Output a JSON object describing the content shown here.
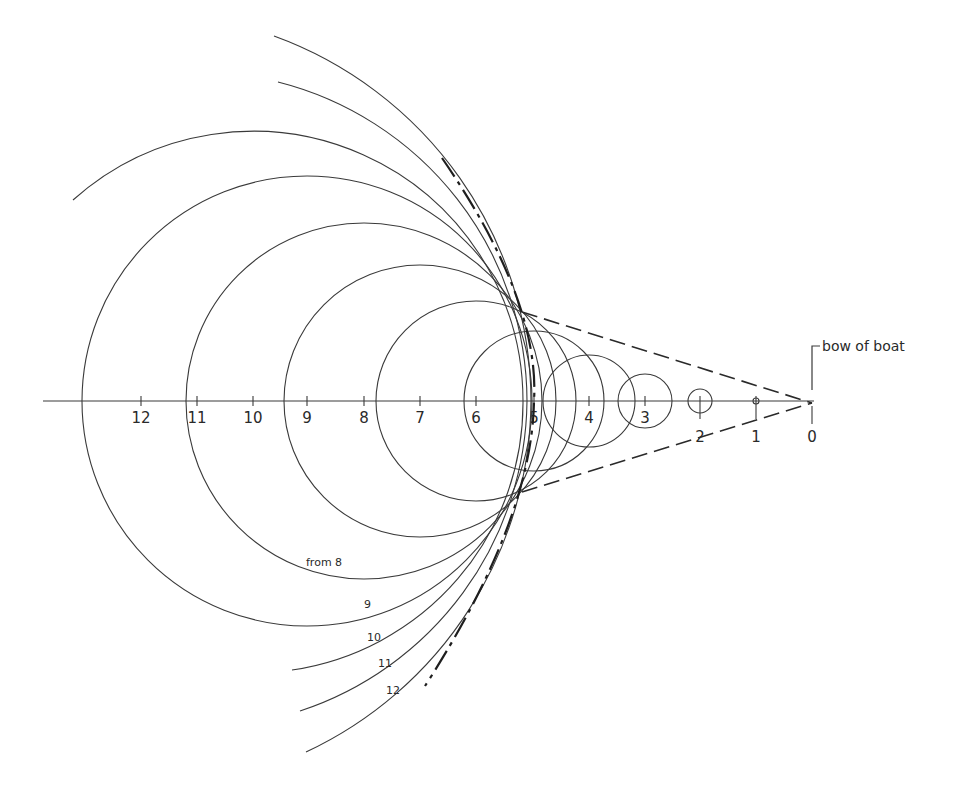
{
  "figure": {
    "type": "wave-front construction diagram",
    "colors": {
      "line": "#3a3a3a",
      "background": "#ffffff"
    },
    "axis": {
      "y": 401,
      "x_start": 43,
      "x_end": 814,
      "ticks": [
        {
          "label": "12",
          "x": 141
        },
        {
          "label": "11",
          "x": 197
        },
        {
          "label": "10",
          "x": 253
        },
        {
          "label": "9",
          "x": 307
        },
        {
          "label": "8",
          "x": 364
        },
        {
          "label": "7",
          "x": 420
        },
        {
          "label": "6",
          "x": 476
        },
        {
          "label": "5",
          "x": 534
        },
        {
          "label": "4",
          "x": 589
        },
        {
          "label": "3",
          "x": 645
        },
        {
          "label": "2",
          "x": 700
        },
        {
          "label": "1",
          "x": 756
        },
        {
          "label": "0",
          "x": 812
        }
      ]
    },
    "bow_label": "bow of boat",
    "circles": [
      {
        "from": "1",
        "cx": 756,
        "r": 3
      },
      {
        "from": "2",
        "cx": 700,
        "r": 12
      },
      {
        "from": "3",
        "cx": 645,
        "r": 27
      },
      {
        "from": "4",
        "cx": 589,
        "r": 46
      },
      {
        "from": "5",
        "cx": 534,
        "r": 70
      },
      {
        "from": "6",
        "cx": 476,
        "r": 100
      },
      {
        "from": "7",
        "cx": 420,
        "r": 136
      },
      {
        "from": "8",
        "cx": 364,
        "r": 178
      },
      {
        "from": "9",
        "cx": 307,
        "r": 225
      },
      {
        "from": "10",
        "cx": 253,
        "r": 270
      },
      {
        "from": "11",
        "cx": 197,
        "r": 330
      },
      {
        "from": "12",
        "cx": 141,
        "r": 390
      }
    ],
    "arc_labels": [
      {
        "text": "from 8",
        "x": 306,
        "y": 566
      },
      {
        "text": "9",
        "x": 364,
        "y": 608
      },
      {
        "text": "10",
        "x": 367,
        "y": 641
      },
      {
        "text": "11",
        "x": 378,
        "y": 667
      },
      {
        "text": "12",
        "x": 386,
        "y": 694
      }
    ]
  }
}
